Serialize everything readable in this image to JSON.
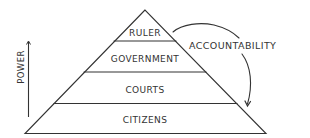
{
  "diagram": {
    "type": "pyramid",
    "tiers": [
      {
        "label": "RULER",
        "level": 1
      },
      {
        "label": "GOVERNMENT",
        "level": 2
      },
      {
        "label": "COURTS",
        "level": 3
      },
      {
        "label": "CITIZENS",
        "level": 4
      }
    ],
    "axis": {
      "label": "POWER",
      "direction": "up"
    },
    "relation": {
      "label": "ACCOUNTABILITY",
      "from": "RULER",
      "to": "CITIZENS",
      "arrow": "curved-arrow"
    },
    "colors": {
      "stroke": "#333333",
      "background": "#ffffff"
    }
  }
}
